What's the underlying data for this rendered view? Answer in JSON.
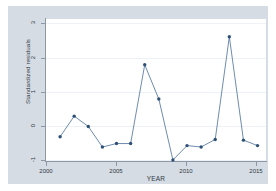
{
  "chart_data": {
    "type": "line",
    "title": "",
    "xlabel": "YEAR",
    "ylabel": "Standardized residuals",
    "xlim": [
      2000,
      2015.6
    ],
    "ylim": [
      -1.1,
      3.15
    ],
    "grid": true,
    "legend": false,
    "xticks": [
      "2000",
      "2005",
      "2010",
      "2015"
    ],
    "xtick_values": [
      2000,
      2005,
      2010,
      2015
    ],
    "yticks": [
      "-1",
      "0",
      "1",
      "2",
      "3"
    ],
    "ytick_values": [
      -1,
      0,
      1,
      2,
      3
    ],
    "marker": "filled-circle",
    "line_color": "#4a6f99",
    "marker_color": "#2d5077",
    "x": [
      2001,
      2002,
      2003,
      2004,
      2005,
      2006,
      2007,
      2008,
      2009,
      2010,
      2011,
      2012,
      2013,
      2014,
      2015
    ],
    "values": [
      -0.32,
      0.28,
      -0.02,
      -0.62,
      -0.52,
      -0.52,
      1.78,
      0.78,
      -1.0,
      -0.58,
      -0.62,
      -0.4,
      2.6,
      -0.42,
      -0.58
    ],
    "points": [
      {
        "x": 2001,
        "y": -0.32
      },
      {
        "x": 2002,
        "y": 0.28
      },
      {
        "x": 2003,
        "y": -0.02
      },
      {
        "x": 2004,
        "y": -0.62
      },
      {
        "x": 2005,
        "y": -0.52
      },
      {
        "x": 2006,
        "y": -0.52
      },
      {
        "x": 2007,
        "y": 1.78
      },
      {
        "x": 2008,
        "y": 0.78
      },
      {
        "x": 2009,
        "y": -1.0
      },
      {
        "x": 2010,
        "y": -0.58
      },
      {
        "x": 2011,
        "y": -0.62
      },
      {
        "x": 2012,
        "y": -0.4
      },
      {
        "x": 2013,
        "y": 2.6
      },
      {
        "x": 2014,
        "y": -0.42
      },
      {
        "x": 2015,
        "y": -0.58
      }
    ],
    "colors": {
      "graph_region": "#d6dce3",
      "plot_area": "#ffffff",
      "gridline": "#eef1f5",
      "axis": "#8e98a5",
      "text": "#2f3a45"
    }
  }
}
